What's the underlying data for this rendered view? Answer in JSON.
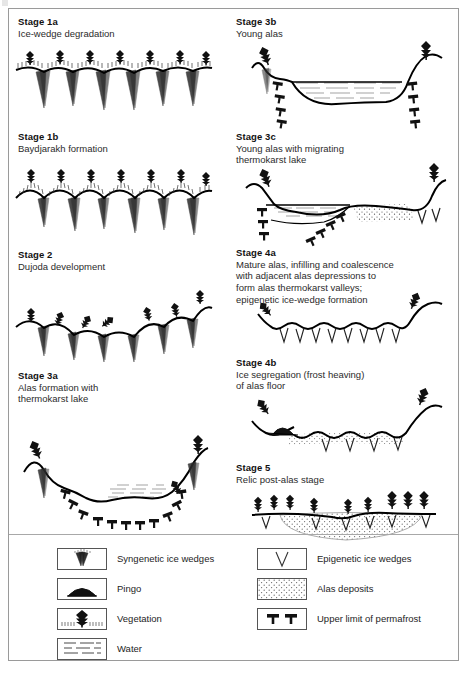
{
  "figure": {
    "border_color": "#9a9a9a",
    "ink_color": "#000000"
  },
  "panels": [
    {
      "id": "stage-1a",
      "column": "left",
      "title": "Stage 1a",
      "subtitle": "Ice-wedge degradation",
      "features": [
        "syngenetic-ice-wedges",
        "vegetation",
        "flat-tundra-surface"
      ]
    },
    {
      "id": "stage-1b",
      "column": "left",
      "title": "Stage 1b",
      "subtitle": "Baydjarakh formation",
      "features": [
        "syngenetic-ice-wedges",
        "vegetation",
        "mound-surface"
      ]
    },
    {
      "id": "stage-2",
      "column": "left",
      "title": "Stage 2",
      "subtitle": "Dujoda development",
      "features": [
        "syngenetic-ice-wedges",
        "vegetation",
        "subsiding-surface"
      ]
    },
    {
      "id": "stage-3a",
      "column": "left",
      "title": "Stage 3a",
      "subtitle": "Alas formation with\nthermokarst lake",
      "subtitle_lines": [
        "Alas formation with",
        "thermokarst lake"
      ],
      "features": [
        "thermokarst-lake",
        "water",
        "upper-limit-of-permafrost",
        "vegetation",
        "syngenetic-ice-wedges"
      ]
    },
    {
      "id": "stage-3b",
      "column": "right",
      "title": "Stage 3b",
      "subtitle": "Young alas",
      "subtitle_lines": [
        "Young alas"
      ],
      "features": [
        "water",
        "upper-limit-of-permafrost",
        "vegetation",
        "syngenetic-ice-wedges"
      ]
    },
    {
      "id": "stage-3c",
      "column": "right",
      "title": "Stage 3c",
      "subtitle": "Young alas with migrating\nthermokarst lake",
      "subtitle_lines": [
        "Young alas with migrating",
        "thermokarst lake"
      ],
      "features": [
        "water",
        "alas-deposits",
        "upper-limit-of-permafrost",
        "epigenetic-ice-wedges",
        "vegetation"
      ]
    },
    {
      "id": "stage-4a",
      "column": "right",
      "title": "Stage 4a",
      "subtitle": "Mature alas, infilling and coalescence with adjacent alas depressions to form alas thermokarst valleys; epigenetic ice-wedge formation",
      "subtitle_lines": [
        "Mature alas, infilling and coalescence",
        "with adjacent alas depressions to",
        "form alas thermokarst valleys;",
        "epigenetic ice-wedge formation"
      ],
      "features": [
        "epigenetic-ice-wedges",
        "vegetation",
        "undulating-alas-floor"
      ]
    },
    {
      "id": "stage-4b",
      "column": "right",
      "title": "Stage 4b",
      "subtitle": "Ice segregation (frost heaving)\nof alas floor",
      "subtitle_lines": [
        "Ice segregation (frost heaving)",
        "of alas floor"
      ],
      "features": [
        "pingo",
        "alas-deposits",
        "epigenetic-ice-wedges",
        "vegetation"
      ]
    },
    {
      "id": "stage-5",
      "column": "right",
      "title": "Stage 5",
      "subtitle": "Relic post-alas stage",
      "subtitle_lines": [
        "Relic post-alas stage"
      ],
      "features": [
        "alas-deposits",
        "epigenetic-ice-wedges",
        "vegetation"
      ]
    }
  ],
  "legend": {
    "left_column": [
      {
        "icon": "syngenetic-ice-wedges-icon",
        "label": "Syngenetic ice wedges"
      },
      {
        "icon": "pingo-icon",
        "label": "Pingo"
      },
      {
        "icon": "vegetation-icon",
        "label": "Vegetation"
      },
      {
        "icon": "water-icon",
        "label": "Water"
      }
    ],
    "right_column": [
      {
        "icon": "epigenetic-ice-wedges-icon",
        "label": "Epigenetic ice wedges"
      },
      {
        "icon": "alas-deposits-icon",
        "label": "Alas deposits"
      },
      {
        "icon": "upper-limit-of-permafrost-icon",
        "label": "Upper limit of permafrost"
      }
    ]
  }
}
